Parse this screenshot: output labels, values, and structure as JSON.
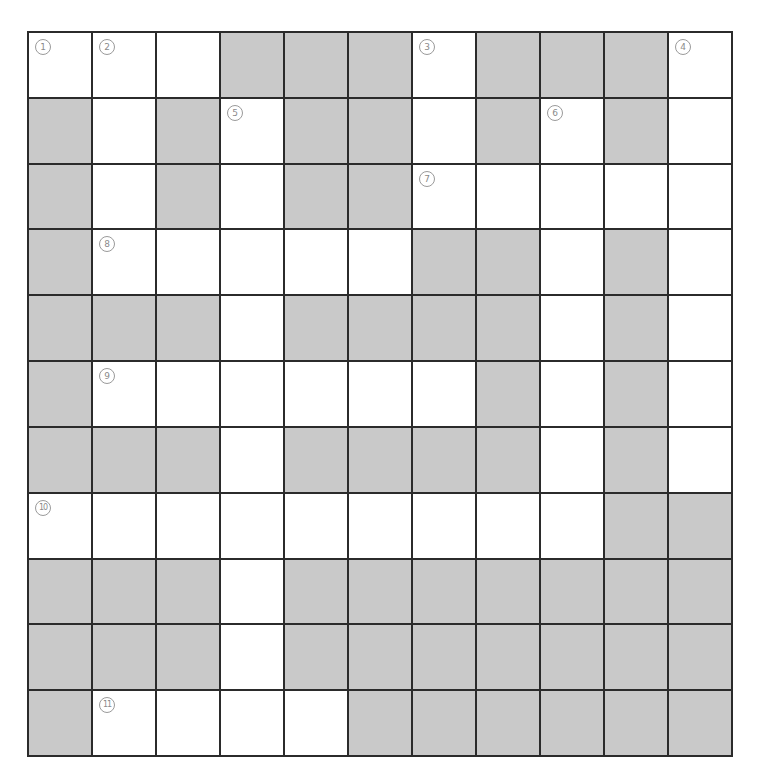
{
  "puzzle": {
    "rows": 11,
    "cols": 11,
    "colors": {
      "blocked": "#c9c9c9",
      "open": "#ffffff",
      "line": "#2b2b2b",
      "number": "#8a8a8a"
    },
    "layout": [
      "WWWBBBWBBBW",
      "BWBWBBWBWBW",
      "BWBWBBWWWWW",
      "BWWWWWBBWBW",
      "BBBWBBBBWBW",
      "BWWWWWWBWBW",
      "BBBWBBBBWBW",
      "WWWWWWWWWBB",
      "BBBWBBBBBBB",
      "BBBWBBBBBBB",
      "BWWWWBBBBBB"
    ],
    "clue_numbers": [
      {
        "row": 0,
        "col": 0,
        "label": "①"
      },
      {
        "row": 0,
        "col": 1,
        "label": "②"
      },
      {
        "row": 0,
        "col": 6,
        "label": "③"
      },
      {
        "row": 0,
        "col": 10,
        "label": "④"
      },
      {
        "row": 1,
        "col": 3,
        "label": "⑤"
      },
      {
        "row": 1,
        "col": 8,
        "label": "⑥"
      },
      {
        "row": 2,
        "col": 6,
        "label": "⑦"
      },
      {
        "row": 3,
        "col": 1,
        "label": "⑧"
      },
      {
        "row": 5,
        "col": 1,
        "label": "⑨"
      },
      {
        "row": 7,
        "col": 0,
        "label": "⑩"
      },
      {
        "row": 10,
        "col": 1,
        "label": "⑪"
      }
    ]
  }
}
